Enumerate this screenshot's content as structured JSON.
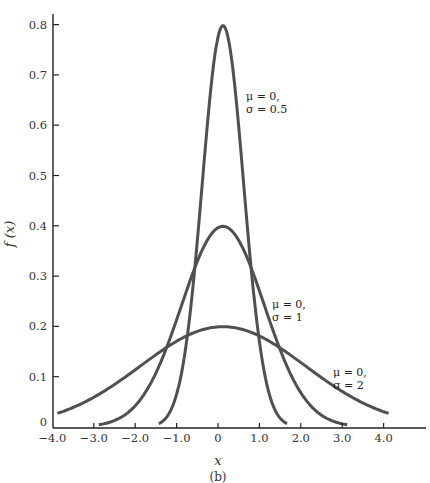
{
  "chart_data": {
    "type": "line",
    "title": "",
    "caption": "(b)",
    "xlabel": "x",
    "ylabel": "f (x)",
    "xlim": [
      -4.0,
      4.6
    ],
    "ylim": [
      0,
      0.82
    ],
    "grid": false,
    "legend": "none (curves labeled by inline annotations)",
    "x_ticks": [
      -4.0,
      -3.0,
      -2.0,
      -1.0,
      0,
      1.0,
      2.0,
      3.0,
      4.0
    ],
    "x_tick_labels": [
      "−4.0",
      "−3.0",
      "−2.0",
      "−1.0",
      "0",
      "1.0",
      "2.0",
      "3.0",
      "4.0"
    ],
    "y_ticks": [
      0,
      0.1,
      0.2,
      0.3,
      0.4,
      0.5,
      0.6,
      0.7,
      0.8
    ],
    "y_tick_labels": [
      "0",
      "0.1",
      "0.2",
      "0.3",
      "0.4",
      "0.5",
      "0.6",
      "0.7",
      "0.8"
    ],
    "series": [
      {
        "name": "μ = 0, σ = 0.5",
        "mu": 0,
        "sigma": 0.5,
        "x_range": [
          -1.55,
          1.55
        ],
        "x": [
          -1.5,
          -1.0,
          -0.5,
          0,
          0.5,
          1.0,
          1.5
        ],
        "values": [
          0.009,
          0.108,
          0.484,
          0.798,
          0.484,
          0.108,
          0.009
        ],
        "annotation": [
          "μ = 0,",
          "σ = 0.5"
        ]
      },
      {
        "name": "μ = 0, σ = 1",
        "mu": 0,
        "sigma": 1,
        "x_range": [
          -3.0,
          3.0
        ],
        "x": [
          -3,
          -2,
          -1,
          0,
          1,
          2,
          3
        ],
        "values": [
          0.004,
          0.054,
          0.242,
          0.399,
          0.242,
          0.054,
          0.004
        ],
        "annotation": [
          "μ = 0,",
          "σ = 1"
        ]
      },
      {
        "name": "μ = 0, σ = 2",
        "mu": 0,
        "sigma": 2,
        "x_range": [
          -4.0,
          4.0
        ],
        "x": [
          -4,
          -3,
          -2,
          -1,
          0,
          1,
          2,
          3,
          4
        ],
        "values": [
          0.027,
          0.065,
          0.121,
          0.176,
          0.199,
          0.176,
          0.121,
          0.065,
          0.027
        ],
        "annotation": [
          "μ = 0,",
          "σ = 2"
        ]
      }
    ]
  }
}
